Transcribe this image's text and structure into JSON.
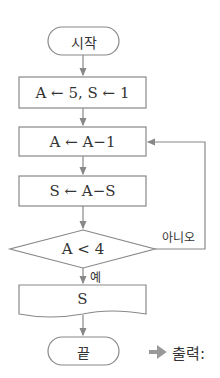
{
  "flowchart": {
    "start": "시작",
    "init": "A ← 5, S ← 1",
    "step1": "A ← A−1",
    "step2": "S ← A−S",
    "condition": "A < 4",
    "no_label": "아니오",
    "yes_label": "예",
    "output": "S",
    "end": "끝",
    "result_label": "출력:",
    "result_arrow": "➡"
  },
  "colors": {
    "stroke": "#888888",
    "text": "#333333",
    "arrow": "#999999"
  }
}
